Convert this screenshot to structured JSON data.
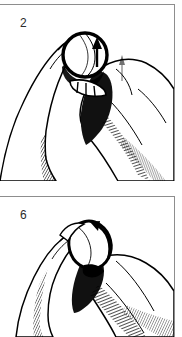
{
  "document": {
    "type": "instructional-illustration",
    "style": "pen-and-ink line drawing, black on white",
    "subject": "hand holding a small spherical object (marble / coin-sized ball) between thumb and fingers",
    "panel_count": 2,
    "background_color": "#ffffff",
    "ink_color": "#000000",
    "border_color": "#8d8d8d"
  },
  "panels": [
    {
      "id": "panel-2",
      "number": "2",
      "caption": "",
      "arrow": {
        "name": "up-arrow",
        "direction": "up",
        "description": "straight arrow pointing upward across the ball"
      },
      "ball": {
        "name": "ball",
        "shading": "outlined sphere with vertical hatch shading on the right side"
      },
      "hands": "two hands meeting at center; left thumb on the left, right index finger entering from the right and extending to the lower-right corner"
    },
    {
      "id": "panel-6",
      "number": "6",
      "caption": "",
      "arrow": {
        "name": "curved-arrow",
        "direction": "counterclockwise",
        "description": "curved arrow sweeping over the top-right of the ball"
      },
      "ball": {
        "name": "ball",
        "shading": "outlined oval sphere, light with thin contour shading"
      },
      "hands": "single hand, fingers curled, holding the ball at the fingertips with a second finger crossing to the lower-right"
    }
  ]
}
